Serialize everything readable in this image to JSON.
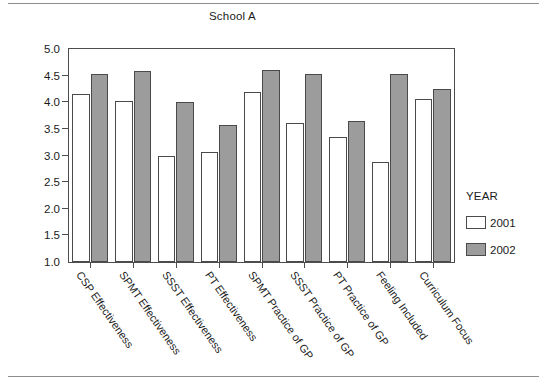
{
  "chart_data": {
    "type": "bar",
    "title": "School A",
    "xlabel": "",
    "ylabel": "",
    "ylim": [
      1.0,
      5.0
    ],
    "ytick_labels": [
      "5.0",
      "4.5",
      "4.0",
      "3.5",
      "3.0",
      "2.5",
      "2.0",
      "1.5",
      "1.0"
    ],
    "ytick_values": [
      5.0,
      4.5,
      4.0,
      3.5,
      3.0,
      2.5,
      2.0,
      1.5,
      1.0
    ],
    "grid": false,
    "legend_position": "right",
    "legend_title": "YEAR",
    "categories": [
      "CSP Effectiveness",
      "SPMT Effectiveness",
      "SSST Effectiveness",
      "PT Effectiveness",
      "SPMT Practice of GP",
      "SSST Practice of GP",
      "PT Practice of GP",
      "Feeling Included",
      "Curriculum Focus"
    ],
    "series": [
      {
        "name": "2001",
        "color": "#ffffff",
        "values": [
          4.16,
          4.02,
          3.0,
          3.07,
          4.19,
          3.61,
          3.34,
          2.87,
          4.07
        ]
      },
      {
        "name": "2002",
        "color": "#9c9c9c",
        "values": [
          4.54,
          4.58,
          4.01,
          3.57,
          4.6,
          4.53,
          3.65,
          4.53,
          4.25
        ]
      }
    ]
  },
  "legend": {
    "title": "YEAR",
    "entries": [
      {
        "label": "2001",
        "swatch": "white-swatch"
      },
      {
        "label": "2002",
        "swatch": "gray-swatch"
      }
    ]
  }
}
